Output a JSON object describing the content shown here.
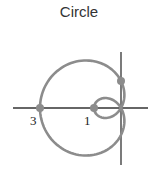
{
  "title": "Circle",
  "chart_data": {
    "type": "line",
    "title": "Circle",
    "curve": "polar limaçon with inner loop, r = 1 - 2cos(theta)",
    "equation": {
      "a": 1,
      "b": -2,
      "form": "r = a + b*cos(theta)"
    },
    "scale_px_per_unit": 27,
    "origin_px": [
      121,
      108
    ],
    "axes": {
      "x_axis": {
        "from_px": 13,
        "to_px": 148
      },
      "y_axis": {
        "from_px": 52,
        "to_px": 165
      }
    },
    "labeled_points": [
      {
        "label": "3",
        "x": -3,
        "y": 0
      },
      {
        "label": "1",
        "x": -1,
        "y": 0
      }
    ],
    "marked_points": [
      {
        "x": -3,
        "y": 0
      },
      {
        "x": -1,
        "y": 0
      },
      {
        "x": 0,
        "y": 1
      }
    ],
    "colors": {
      "curve": "#8c8c8c",
      "axes": "#333333",
      "points": "#8c8c8c",
      "labels": "#222222"
    }
  }
}
